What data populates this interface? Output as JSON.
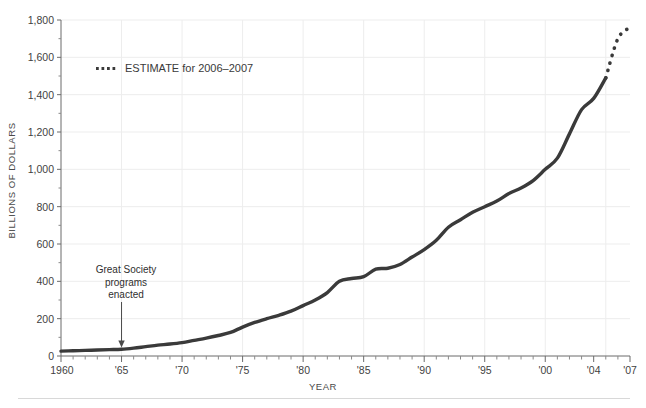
{
  "chart_data": {
    "type": "line",
    "title": "",
    "xlabel": "YEAR",
    "ylabel": "BILLIONS OF DOLLARS",
    "xlim": [
      1960,
      2007
    ],
    "ylim": [
      0,
      1800
    ],
    "grid": true,
    "legend_position": "upper-left-inside",
    "y_ticks": [
      0,
      200,
      400,
      600,
      800,
      1000,
      1200,
      1400,
      1600,
      1800
    ],
    "y_tick_labels": [
      "0",
      "200",
      "400",
      "600",
      "800",
      "1,000",
      "1,200",
      "1,400",
      "1,600",
      "1,800"
    ],
    "x_ticks": [
      1960,
      1965,
      1970,
      1975,
      1980,
      1985,
      1990,
      1995,
      2000,
      2004,
      2007
    ],
    "x_tick_labels": [
      "1960",
      "'65",
      "'70",
      "'75",
      "'80",
      "'85",
      "'90",
      "'95",
      "'00",
      "'04",
      "'07"
    ],
    "minor_x_tick_interval": 1,
    "line_color": "#3a3a3a",
    "grid_color": "#ededed",
    "background_color": "#ffffff",
    "series": [
      {
        "name": "Actual spending",
        "style": "solid",
        "x": [
          1960,
          1961,
          1962,
          1963,
          1964,
          1965,
          1966,
          1967,
          1968,
          1969,
          1970,
          1971,
          1972,
          1973,
          1974,
          1975,
          1976,
          1977,
          1978,
          1979,
          1980,
          1981,
          1982,
          1983,
          1984,
          1985,
          1986,
          1987,
          1988,
          1989,
          1990,
          1991,
          1992,
          1993,
          1994,
          1995,
          1996,
          1997,
          1998,
          1999,
          2000,
          2001,
          2002,
          2003,
          2004,
          2005
        ],
        "values": [
          26,
          28,
          30,
          32,
          34,
          36,
          42,
          50,
          58,
          64,
          72,
          84,
          96,
          110,
          126,
          155,
          180,
          200,
          218,
          240,
          270,
          300,
          340,
          400,
          415,
          425,
          465,
          470,
          490,
          530,
          570,
          620,
          690,
          730,
          770,
          800,
          830,
          870,
          900,
          940,
          1000,
          1060,
          1190,
          1320,
          1380,
          1490
        ]
      },
      {
        "name": "ESTIMATE for 2006-2007",
        "style": "dotted",
        "x": [
          2005,
          2006,
          2007
        ],
        "values": [
          1490,
          1700,
          1760
        ]
      }
    ],
    "annotations": [
      {
        "name": "great-society-annotation",
        "text_lines": [
          "Great Society",
          "programs",
          "enacted"
        ],
        "x": 1965,
        "y": 40,
        "arrow": "down"
      }
    ],
    "legend_entries": [
      {
        "label": "ESTIMATE for 2006–2007",
        "style": "dotted",
        "color": "#3a3a3a"
      }
    ]
  }
}
